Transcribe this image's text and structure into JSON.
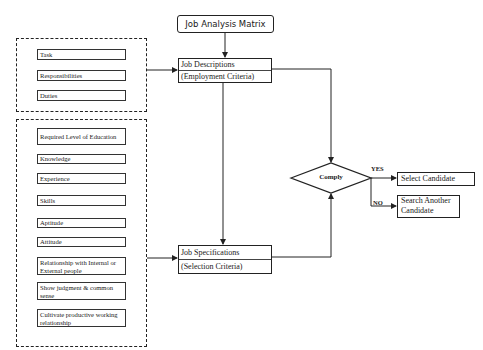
{
  "title": "Job Analysis Matrix",
  "job_descriptions": {
    "line1": "Job Descriptions",
    "line2": "(Employment Criteria)"
  },
  "job_specifications": {
    "line1": "Job Specifications",
    "line2": "(Selection Criteria)"
  },
  "description_items": [
    "Task",
    "Responsibilities",
    "Duties"
  ],
  "specification_items": [
    "Required Level of Education",
    "Knowledge",
    "Experience",
    "Skills",
    "Aptitude",
    "Attitude",
    "Relationship with Internal or External people",
    "Show judgment & common sense",
    "Cultivate productive working relationship"
  ],
  "decision": {
    "label": "Comply",
    "yes_label": "YES",
    "no_label": "NO"
  },
  "outcomes": {
    "yes": "Select Candidate",
    "no": "Search Another Candidate"
  }
}
